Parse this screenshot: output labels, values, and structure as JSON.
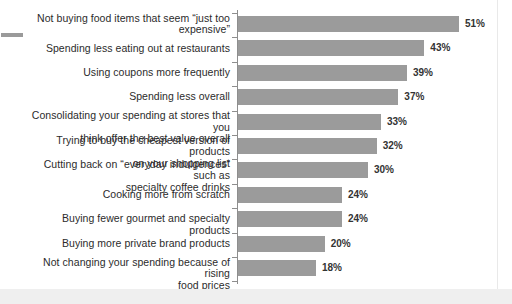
{
  "chart_data": {
    "type": "bar",
    "orientation": "horizontal",
    "title": "",
    "subtitle": "",
    "xlabel": "",
    "ylabel": "",
    "grid": false,
    "legend": null,
    "xlim": [
      0,
      51
    ],
    "value_suffix": "%",
    "bar_color": "#9b9b9b",
    "axis_color": "#8e8e8e",
    "categories": [
      "Not buying food items that seem “just too expensive”",
      "Spending less eating out at restaurants",
      "Using coupons more frequently",
      "Spending less overall",
      "Consolidating your spending at stores that you think offer the best value overall",
      "Trying to buy the cheapest version of products on your shopping list",
      "Cutting back on “everyday indulgences” such as specialty coffee drinks",
      "Cooking more from scratch",
      "Buying fewer gourmet and specialty products",
      "Buying more private brand products",
      "Not changing your spending because of rising food prices"
    ],
    "values": [
      51,
      43,
      39,
      37,
      33,
      32,
      30,
      24,
      24,
      20,
      18
    ],
    "data_labels": [
      "51%",
      "43%",
      "39%",
      "37%",
      "33%",
      "32%",
      "30%",
      "24%",
      "24%",
      "20%",
      "18%"
    ]
  },
  "rows": [
    {
      "label_line1": "Not buying food items that seem “just too",
      "label_line2": "expensive”",
      "value": 51,
      "value_label": "51%"
    },
    {
      "label_line1": "Spending less eating out at restaurants",
      "label_line2": "",
      "value": 43,
      "value_label": "43%"
    },
    {
      "label_line1": "Using coupons more frequently",
      "label_line2": "",
      "value": 39,
      "value_label": "39%"
    },
    {
      "label_line1": "Spending less overall",
      "label_line2": "",
      "value": 37,
      "value_label": "37%"
    },
    {
      "label_line1": "Consolidating your spending at stores that you",
      "label_line2": "think offer the best value overall",
      "value": 33,
      "value_label": "33%"
    },
    {
      "label_line1": "Trying to buy the cheapest version of products",
      "label_line2": "on your shopping list",
      "value": 32,
      "value_label": "32%"
    },
    {
      "label_line1": "Cutting back on “everyday indulgences” such as",
      "label_line2": "specialty coffee drinks",
      "value": 30,
      "value_label": "30%"
    },
    {
      "label_line1": "Cooking more from scratch",
      "label_line2": "",
      "value": 24,
      "value_label": "24%"
    },
    {
      "label_line1": "Buying fewer gourmet and specialty products",
      "label_line2": "",
      "value": 24,
      "value_label": "24%"
    },
    {
      "label_line1": "Buying more private brand products",
      "label_line2": "",
      "value": 20,
      "value_label": "20%"
    },
    {
      "label_line1": "Not changing your spending because of rising",
      "label_line2": "food prices",
      "value": 18,
      "value_label": "18%"
    }
  ]
}
